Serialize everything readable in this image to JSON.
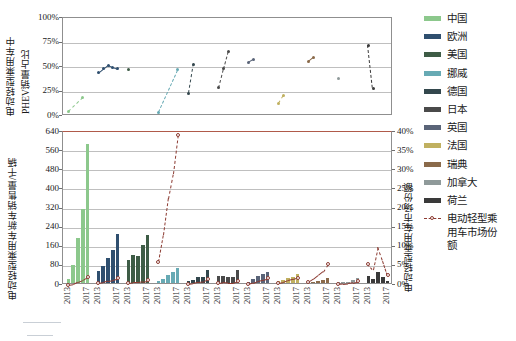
{
  "chart_data": {
    "type": "bar",
    "title": "",
    "panels": [
      {
        "id": "top",
        "type": "scatter",
        "ylabel_line1": "电动轻型乘用车中",
        "ylabel_line2": "PHEV销量占比",
        "yticks": [
          "100%",
          "75%",
          "50%",
          "25%",
          "0%"
        ],
        "ylim": [
          0,
          100
        ],
        "grid": true,
        "series": [
          {
            "name": "中国",
            "color": "#8cc88c",
            "values": [
              5,
              null,
              null,
              19,
              null
            ]
          },
          {
            "name": "欧洲",
            "color": "#2f4f6f",
            "values": [
              44,
              48,
              52,
              50,
              48
            ]
          },
          {
            "name": "美国",
            "color": "#3e5c46",
            "values": [
              47,
              null,
              null,
              null,
              null
            ]
          },
          {
            "name": "挪威",
            "color": "#67aab4",
            "values": [
              4,
              null,
              null,
              null,
              47
            ]
          },
          {
            "name": "德国",
            "color": "#33474d",
            "values": [
              23,
              53,
              null,
              null,
              null
            ]
          },
          {
            "name": "日本",
            "color": "#4a4a4a",
            "values": [
              29,
              48,
              66,
              null,
              null
            ]
          },
          {
            "name": "英国",
            "color": "#5a6478",
            "values": [
              55,
              58,
              null,
              null,
              null
            ]
          },
          {
            "name": "法国",
            "color": "#c0b060",
            "values": [
              13,
              21,
              null,
              null,
              null
            ]
          },
          {
            "name": "瑞典",
            "color": "#8a6a4a",
            "values": [
              56,
              60,
              null,
              null,
              null
            ]
          },
          {
            "name": "加拿大",
            "color": "#8f9a9a",
            "values": [
              38,
              null,
              null,
              null,
              null
            ]
          },
          {
            "name": "荷兰",
            "color": "#3a3a3a",
            "values": [
              72,
              28,
              null,
              null,
              null
            ]
          }
        ]
      },
      {
        "id": "bottom",
        "type": "bar",
        "ylabel_left": "电动轻型乘用车新车销售量/千辆",
        "ylabel_right": "电动轻型乘用车市场份额",
        "yticks_left": [
          "640",
          "560",
          "480",
          "400",
          "320",
          "240",
          "160",
          "80",
          "0"
        ],
        "yticks_right": [
          "40%",
          "35%",
          "30%",
          "25%",
          "20%",
          "15%",
          "10%",
          "5%",
          "0%"
        ],
        "ylim_left": [
          0,
          640
        ],
        "ylim_right": [
          0,
          40
        ],
        "grid": true,
        "xticks": [
          "2013",
          "2017"
        ],
        "share_series_name": "电动轻型乘用车市场份额",
        "share_color": "#8c3b32",
        "groups": [
          {
            "name": "中国",
            "color": "#8cc88c",
            "sales": [
              15,
              75,
              190,
              310,
              580
            ],
            "share": [
              0.1,
              0.3,
              0.9,
              1.4,
              2.2
            ]
          },
          {
            "name": "欧洲",
            "color": "#2f4f6f",
            "sales": [
              50,
              70,
              105,
              140,
              205
            ],
            "share": [
              0.5,
              0.7,
              1.1,
              1.3,
              1.7
            ]
          },
          {
            "name": "美国",
            "color": "#3e5c46",
            "sales": [
              96,
              118,
              114,
              158,
              200
            ],
            "share": [
              0.6,
              0.7,
              0.7,
              0.9,
              1.2
            ]
          },
          {
            "name": "挪威",
            "color": "#67aab4",
            "sales": [
              8,
              18,
              32,
              45,
              62
            ],
            "share": [
              6.0,
              13.0,
              22.5,
              29.0,
              39.2
            ]
          },
          {
            "name": "德国",
            "color": "#33474d",
            "sales": [
              7,
              13,
              24,
              25,
              55
            ],
            "share": [
              0.2,
              0.4,
              0.7,
              0.8,
              1.6
            ]
          },
          {
            "name": "日本",
            "color": "#4a4a4a",
            "sales": [
              28,
              31,
              25,
              24,
              56
            ],
            "share": [
              0.6,
              0.7,
              0.6,
              0.6,
              1.1
            ]
          },
          {
            "name": "英国",
            "color": "#5a6478",
            "sales": [
              4,
              15,
              28,
              37,
              47
            ],
            "share": [
              0.2,
              0.6,
              1.1,
              1.4,
              1.8
            ]
          },
          {
            "name": "法国",
            "color": "#c0b060",
            "sales": [
              9,
              12,
              22,
              27,
              36
            ],
            "share": [
              0.5,
              0.7,
              1.2,
              1.5,
              1.9
            ]
          },
          {
            "name": "瑞典",
            "color": "#8a6a4a",
            "sales": [
              2,
              5,
              9,
              13,
              20
            ],
            "share": [
              0.7,
              1.5,
              2.5,
              3.5,
              5.5
            ]
          },
          {
            "name": "加拿大",
            "color": "#8f9a9a",
            "sales": [
              2,
              5,
              6,
              11,
              19
            ],
            "share": [
              0.2,
              0.3,
              0.4,
              0.6,
              1.0
            ]
          },
          {
            "name": "荷兰",
            "color": "#3a3a3a",
            "sales": [
              28,
              15,
              44,
              25,
              10
            ],
            "share": [
              5.4,
              3.9,
              9.9,
              6.4,
              2.6
            ]
          }
        ]
      }
    ]
  },
  "legend": {
    "items": [
      {
        "label": "中国",
        "color": "#8cc88c",
        "kind": "swatch"
      },
      {
        "label": "欧洲",
        "color": "#2f4f6f",
        "kind": "swatch"
      },
      {
        "label": "美国",
        "color": "#3e5c46",
        "kind": "swatch"
      },
      {
        "label": "挪威",
        "color": "#67aab4",
        "kind": "swatch"
      },
      {
        "label": "德国",
        "color": "#33474d",
        "kind": "swatch"
      },
      {
        "label": "日本",
        "color": "#4a4a4a",
        "kind": "swatch"
      },
      {
        "label": "英国",
        "color": "#5a6478",
        "kind": "swatch"
      },
      {
        "label": "法国",
        "color": "#c0b060",
        "kind": "swatch"
      },
      {
        "label": "瑞典",
        "color": "#8a6a4a",
        "kind": "swatch"
      },
      {
        "label": "加拿大",
        "color": "#8f9a9a",
        "kind": "swatch"
      },
      {
        "label": "荷兰",
        "color": "#3a3a3a",
        "kind": "swatch"
      },
      {
        "label": "电动轻型乘用车市场份额",
        "color": "#8c3b32",
        "kind": "dashline"
      }
    ]
  }
}
